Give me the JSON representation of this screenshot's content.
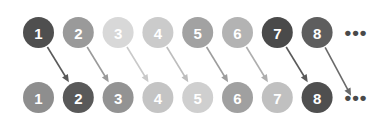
{
  "diagram": {
    "background_color": "#ffffff",
    "layout": {
      "width": 387,
      "height": 123,
      "node_radius": 15.5,
      "first_node_cx": 38.5,
      "node_spacing": 39.8,
      "top_row_cy": 32.5,
      "bottom_row_cy": 97.5,
      "ellipsis_cx": 356,
      "label_color": "#ffffff"
    },
    "top_row": {
      "name": "top-row",
      "nodes": [
        {
          "label": "1",
          "color": "#4f4f4f"
        },
        {
          "label": "2",
          "color": "#9a9a9a"
        },
        {
          "label": "3",
          "color": "#d8d8d8"
        },
        {
          "label": "4",
          "color": "#cbcbcb"
        },
        {
          "label": "5",
          "color": "#a2a2a2"
        },
        {
          "label": "6",
          "color": "#b3b3b3"
        },
        {
          "label": "7",
          "color": "#4a4a4a"
        },
        {
          "label": "8",
          "color": "#5e5e5e"
        }
      ],
      "ellipsis": "•••"
    },
    "bottom_row": {
      "name": "bottom-row",
      "nodes": [
        {
          "label": "1",
          "color": "#8e8e8e"
        },
        {
          "label": "2",
          "color": "#595959"
        },
        {
          "label": "3",
          "color": "#939393"
        },
        {
          "label": "4",
          "color": "#c4c4c4"
        },
        {
          "label": "5",
          "color": "#cfcfcf"
        },
        {
          "label": "6",
          "color": "#a0a0a0"
        },
        {
          "label": "7",
          "color": "#c0c0c0"
        },
        {
          "label": "8",
          "color": "#4f4f4f"
        }
      ],
      "ellipsis": "•••"
    },
    "arrows": [
      {
        "from": "top-1",
        "to": "bottom-2",
        "color": "#5a5a5a"
      },
      {
        "from": "top-2",
        "to": "bottom-3",
        "color": "#9a9a9a"
      },
      {
        "from": "top-3",
        "to": "bottom-4",
        "color": "#c9c9c9"
      },
      {
        "from": "top-4",
        "to": "bottom-5",
        "color": "#bdbdbd"
      },
      {
        "from": "top-5",
        "to": "bottom-6",
        "color": "#9d9d9d"
      },
      {
        "from": "top-6",
        "to": "bottom-7",
        "color": "#aeaeae"
      },
      {
        "from": "top-7",
        "to": "bottom-8",
        "color": "#5a5a5a"
      },
      {
        "from": "top-8",
        "to": "bottom-ellipsis",
        "color": "#6a6a6a"
      }
    ]
  }
}
